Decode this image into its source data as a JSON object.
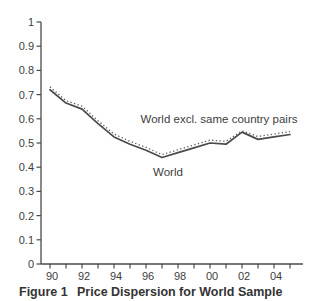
{
  "figure": {
    "caption_label": "Figure 1",
    "caption_title": "Price Dispersion for World Sample"
  },
  "chart_data": {
    "type": "line",
    "title": "Price Dispersion for World Sample",
    "figure_label": "Figure 1",
    "xlabel": "",
    "ylabel": "",
    "ylim": [
      0,
      1
    ],
    "grid": false,
    "legend_position": "inline-annotations",
    "x_categories": [
      "90",
      "91",
      "92",
      "93",
      "94",
      "95",
      "96",
      "97",
      "98",
      "99",
      "00",
      "01",
      "02",
      "03",
      "04",
      "05"
    ],
    "x_tick_labels_shown": [
      "90",
      "92",
      "94",
      "96",
      "98",
      "00",
      "02",
      "04"
    ],
    "y_tick_labels": [
      "0",
      "0.1",
      "0.2",
      "0.3",
      "0.4",
      "0.5",
      "0.6",
      "0.7",
      "0.8",
      "0.9",
      "1"
    ],
    "series": [
      {
        "name": "World",
        "line_style": "solid",
        "values": [
          0.72,
          0.665,
          0.64,
          0.58,
          0.525,
          0.495,
          0.47,
          0.44,
          0.46,
          0.48,
          0.5,
          0.495,
          0.545,
          0.515,
          0.525,
          0.535
        ]
      },
      {
        "name": "World excl. same country pairs",
        "line_style": "dotted",
        "values": [
          0.732,
          0.675,
          0.652,
          0.592,
          0.537,
          0.507,
          0.482,
          0.452,
          0.472,
          0.492,
          0.512,
          0.507,
          0.55,
          0.527,
          0.537,
          0.547
        ]
      }
    ],
    "annotations": [
      {
        "text": "World excl. same country pairs",
        "refers_to": "World excl. same country pairs"
      },
      {
        "text": "World",
        "refers_to": "World"
      }
    ],
    "colors": {
      "solid_line": "#4a4a4a",
      "dotted_line": "#5a5a5a",
      "axis": "#4a4a4a",
      "text": "#3d3d3d",
      "background": "#ffffff"
    }
  }
}
